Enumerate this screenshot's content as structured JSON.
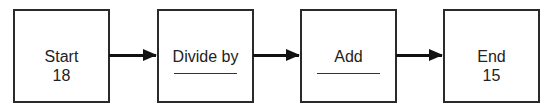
{
  "diagram": {
    "type": "flowchart",
    "boxes": [
      {
        "title": "Start",
        "value": "18"
      },
      {
        "title": "Divide by",
        "value": ""
      },
      {
        "title": "Add",
        "value": ""
      },
      {
        "title": "End",
        "value": "15"
      }
    ],
    "connections": [
      {
        "from": "Start",
        "to": "Divide by"
      },
      {
        "from": "Divide by",
        "to": "Add"
      },
      {
        "from": "Add",
        "to": "End"
      }
    ]
  }
}
